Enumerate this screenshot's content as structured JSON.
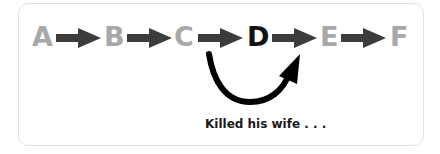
{
  "diagram": {
    "nodes": [
      {
        "label": "A",
        "highlighted": false
      },
      {
        "label": "B",
        "highlighted": false
      },
      {
        "label": "C",
        "highlighted": false
      },
      {
        "label": "D",
        "highlighted": true
      },
      {
        "label": "E",
        "highlighted": false
      },
      {
        "label": "F",
        "highlighted": false
      }
    ],
    "loop": {
      "from": "C",
      "to": "D",
      "caption": "Killed his wife . . ."
    },
    "colors": {
      "dim": "#a8a8a8",
      "active": "#111111",
      "arrow": "#3c3c3c",
      "loop": "#000000",
      "border": "#e2e2e2"
    }
  }
}
